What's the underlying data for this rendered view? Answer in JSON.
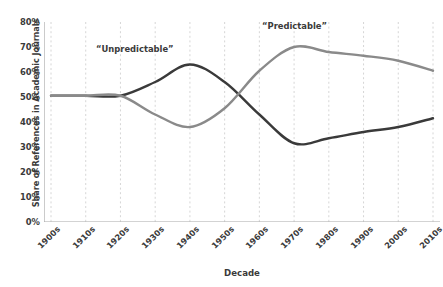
{
  "chart_data": {
    "type": "line",
    "title": "",
    "xlabel": "Decade",
    "ylabel": "Share of References in Academic Journals",
    "categories": [
      "1900s",
      "1910s",
      "1920s",
      "1930s",
      "1940s",
      "1950s",
      "1960s",
      "1970s",
      "1980s",
      "1990s",
      "2000s",
      "2010s"
    ],
    "ylim": [
      0,
      80
    ],
    "yticks": [
      0,
      10,
      20,
      30,
      40,
      50,
      60,
      70,
      80
    ],
    "ytick_labels": [
      "0%",
      "10%",
      "20%",
      "30%",
      "40%",
      "50%",
      "60%",
      "70%",
      "80%"
    ],
    "grid": "vertical-dashed",
    "legend": "inline-annotations",
    "series": [
      {
        "name": "“Unpredictable”",
        "color": "#3a3a3a",
        "values": [
          50.5,
          50.5,
          50.5,
          56.0,
          63.0,
          56.0,
          43.0,
          31.5,
          33.5,
          36.0,
          38.0,
          41.5
        ]
      },
      {
        "name": "“Predictable”",
        "color": "#8a8a8a",
        "values": [
          50.5,
          50.5,
          50.5,
          43.0,
          38.0,
          45.5,
          60.5,
          70.0,
          68.0,
          66.5,
          64.5,
          60.5
        ]
      }
    ],
    "annotations": [
      {
        "text": "“Unpredictable”",
        "series": "“Unpredictable”"
      },
      {
        "text": "“Predictable”",
        "series": "“Predictable”"
      }
    ],
    "axis_color": "#a8a8a8",
    "gridline_color": "#cccccc",
    "background": "#ffffff"
  }
}
